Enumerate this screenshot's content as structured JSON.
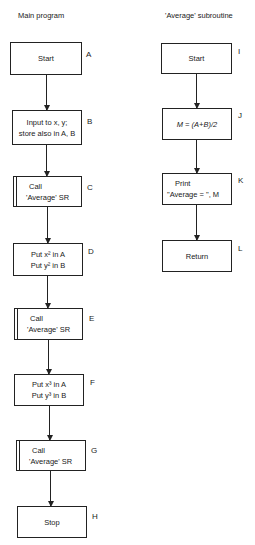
{
  "main_program": {
    "title": "Main program",
    "boxes": [
      {
        "label": "A",
        "lines": [
          "Start"
        ],
        "type": "process"
      },
      {
        "label": "B",
        "lines": [
          "Input to x, y;",
          "store also in A, B"
        ],
        "type": "process"
      },
      {
        "label": "C",
        "lines": [
          "Call",
          "'Average' SR"
        ],
        "type": "subroutine-call"
      },
      {
        "label": "D",
        "lines": [
          "Put x² in A",
          "Put y² in B"
        ],
        "type": "process"
      },
      {
        "label": "E",
        "lines": [
          "Call",
          "'Average' SR"
        ],
        "type": "subroutine-call"
      },
      {
        "label": "F",
        "lines": [
          "Put x³ in A",
          "Put y³ in B"
        ],
        "type": "process"
      },
      {
        "label": "G",
        "lines": [
          "Call",
          "'Average' SR"
        ],
        "type": "subroutine-call"
      },
      {
        "label": "H",
        "lines": [
          "Stop"
        ],
        "type": "process"
      }
    ]
  },
  "subroutine": {
    "title": "'Average' subroutine",
    "boxes": [
      {
        "label": "I",
        "lines": [
          "Start"
        ],
        "type": "process"
      },
      {
        "label": "J",
        "lines": [
          "M = (A+B)/2"
        ],
        "type": "process"
      },
      {
        "label": "K",
        "lines": [
          "Print",
          "\"Average = \", M"
        ],
        "type": "process"
      },
      {
        "label": "L",
        "lines": [
          "Return"
        ],
        "type": "process"
      }
    ]
  }
}
